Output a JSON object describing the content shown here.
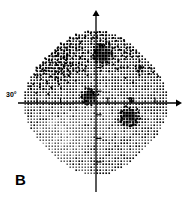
{
  "figure": {
    "panel_letter": "B",
    "type": "visual-field-grayscale-plot",
    "background_color": "#ffffff",
    "ink_color": "#000000"
  },
  "axes": {
    "degree_label": "30°",
    "horizontal_axis_name": "horizontal-meridian",
    "vertical_axis_name": "vertical-meridian",
    "horizontal_tick_count": 6,
    "vertical_tick_count": 6,
    "arrow_right": true,
    "arrow_up": true
  },
  "chart_data": {
    "type": "heatmap",
    "title": "B",
    "xlabel": "",
    "ylabel": "",
    "xlim": [
      -30,
      30
    ],
    "ylim": [
      -30,
      30
    ],
    "grid": false,
    "legend": "none",
    "annotations": [
      "30°",
      "B"
    ],
    "cell_size_deg": 2,
    "shade_scale": {
      "0": "blank",
      "1": "very-light",
      "2": "light",
      "3": "medium-light",
      "4": "medium",
      "5": "medium-dark",
      "6": "dark",
      "7": "very-dark",
      "8": "black"
    },
    "regions": [
      {
        "name": "superior-nasal-upper-left",
        "center": [
          -14,
          16
        ],
        "shade": 5
      },
      {
        "name": "superior-temporal-upper-right",
        "center": [
          14,
          16
        ],
        "shade": 4
      },
      {
        "name": "inferior-lower-left",
        "center": [
          -14,
          -14
        ],
        "shade": 2
      },
      {
        "name": "inferior-lower-right",
        "center": [
          14,
          -16
        ],
        "shade": 3
      },
      {
        "name": "paracentral-ring",
        "center": [
          0,
          0
        ],
        "shade": 3
      }
    ],
    "defects": [
      {
        "name": "superior-paracentral-scotoma",
        "center_deg": [
          3,
          21
        ],
        "radius_deg": 5,
        "shade": 8
      },
      {
        "name": "central-scotoma",
        "center_deg": [
          -3,
          3
        ],
        "radius_deg": 3.5,
        "shade": 8
      },
      {
        "name": "inferior-temporal-scotoma",
        "center_deg": [
          14,
          -6
        ],
        "radius_deg": 4.5,
        "shade": 8
      },
      {
        "name": "superior-temporal-small-defect",
        "center_deg": [
          19,
          14
        ],
        "radius_deg": 1.5,
        "shade": 7
      },
      {
        "name": "temporal-blind-spot",
        "center_deg": [
          15,
          1
        ],
        "radius_deg": 1.5,
        "shade": 7
      }
    ]
  }
}
